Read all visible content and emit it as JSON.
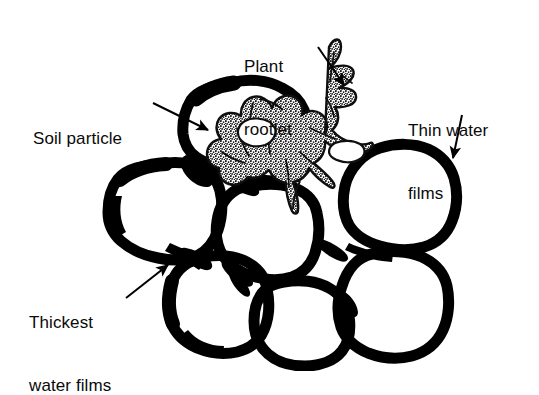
{
  "figure": {
    "background_color": "#ffffff",
    "ink_color": "#000000"
  },
  "labels": {
    "plant_rootlet": {
      "name": "plant-rootlet",
      "line1": "Plant",
      "line2": "rootlet",
      "full": "Plant rootlet",
      "points_to": "rootlet"
    },
    "soil_particle": {
      "name": "soil-particle",
      "line1": "Soil particle",
      "full": "Soil particle",
      "points_to": "top-center soil grain"
    },
    "thin_water_films": {
      "name": "thin-water-films",
      "line1": "Thin water",
      "line2": "films",
      "full": "Thin water films",
      "points_to": "right soil grain outer film"
    },
    "thickest_water_films": {
      "name": "thickest-water-films",
      "line1": "Thickest",
      "line2": "water films",
      "full": "Thickest water films",
      "points_to": "wedge between lower-left grains"
    }
  },
  "diagram_elements": {
    "soil_particles_count": 7,
    "rootlet_texture": "stippled",
    "arrows_count": 4
  }
}
